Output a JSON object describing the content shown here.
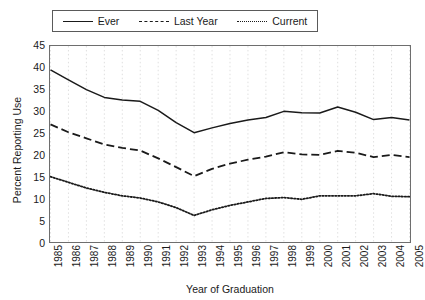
{
  "legend": {
    "position": "top-center",
    "entries": [
      {
        "label": "Ever",
        "style": "solid",
        "icon": "solid-line-icon"
      },
      {
        "label": "Last Year",
        "style": "dashed",
        "icon": "dashed-line-icon"
      },
      {
        "label": "Current",
        "style": "dotted",
        "icon": "dotted-line-icon"
      }
    ]
  },
  "axes": {
    "ylabel": "Percent Reporting Use",
    "xlabel": "Year of Graduation",
    "yticks": [
      0,
      5,
      10,
      15,
      20,
      25,
      30,
      35,
      40,
      45
    ],
    "xticks": [
      "1985",
      "1986",
      "1987",
      "1988",
      "1989",
      "1990",
      "1991",
      "1992",
      "1993",
      "1994",
      "1995",
      "1996",
      "1997",
      "1998",
      "1999",
      "2000",
      "2001",
      "2002",
      "2003",
      "2004",
      "2005"
    ]
  },
  "colors": {
    "line": "#1a1a1a",
    "frame": "#6e6e6e",
    "grid": "#d8d8d8",
    "background": "#ffffff"
  },
  "chart_data": {
    "type": "line",
    "title": "",
    "subtitle": "",
    "xlabel": "Year of Graduation",
    "ylabel": "Percent Reporting Use",
    "xlim": [
      1985,
      2005
    ],
    "ylim": [
      0,
      45
    ],
    "ytick_step": 5,
    "grid": "vertical-dotted",
    "legend_position": "top-center",
    "x": [
      1985,
      1986,
      1987,
      1988,
      1989,
      1990,
      1991,
      1992,
      1993,
      1994,
      1995,
      1996,
      1997,
      1998,
      1999,
      2000,
      2001,
      2002,
      2003,
      2004,
      2005
    ],
    "categories": [
      "1985",
      "1986",
      "1987",
      "1988",
      "1989",
      "1990",
      "1991",
      "1992",
      "1993",
      "1994",
      "1995",
      "1996",
      "1997",
      "1998",
      "1999",
      "2000",
      "2001",
      "2002",
      "2003",
      "2004",
      "2005"
    ],
    "series": [
      {
        "name": "Ever",
        "style": "solid",
        "values": [
          39.5,
          37.2,
          35.0,
          33.2,
          32.6,
          32.3,
          30.2,
          27.4,
          25.1,
          26.2,
          27.2,
          28.0,
          28.6,
          30.0,
          29.7,
          29.6,
          31.0,
          29.8,
          28.1,
          28.6,
          28.0
        ]
      },
      {
        "name": "Last Year",
        "style": "dashed",
        "values": [
          27.0,
          25.2,
          23.8,
          22.4,
          21.6,
          21.0,
          19.2,
          17.2,
          15.1,
          16.8,
          18.0,
          18.9,
          19.6,
          20.6,
          20.1,
          20.0,
          20.9,
          20.5,
          19.5,
          20.0,
          19.5
        ]
      },
      {
        "name": "Current",
        "style": "dotted",
        "values": [
          15.0,
          13.7,
          12.4,
          11.4,
          10.6,
          10.1,
          9.2,
          7.9,
          6.1,
          7.4,
          8.4,
          9.2,
          10.0,
          10.2,
          9.8,
          10.6,
          10.6,
          10.6,
          11.1,
          10.5,
          10.4
        ]
      }
    ]
  }
}
